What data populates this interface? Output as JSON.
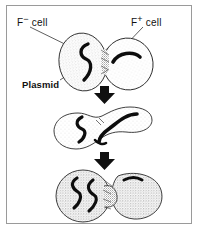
{
  "figure": {
    "background_color": "#ffffff",
    "frame_color": "#9a9a9a",
    "ink_color": "#111111",
    "cell_fill_color": "#fdfdfd",
    "stipple_color": "#8c8c8c"
  },
  "labels": {
    "f_minus": {
      "text": "F",
      "sign": "−",
      "suffix": " cell",
      "full": "F− cell"
    },
    "f_plus": {
      "text": "F",
      "sign": "+",
      "suffix": " cell",
      "full": "F+ cell"
    },
    "plasmid": {
      "text": "Plasmid"
    }
  },
  "stages": [
    {
      "name": "stage-1-contact",
      "description": "Two separate oval bacterial cells touching at a conjugation junction",
      "cells": [
        {
          "name": "f-minus-cell",
          "dna": "chromosome-s-curve",
          "texture": "stippled"
        },
        {
          "name": "f-plus-cell",
          "dna": "plasmid-curve",
          "texture": "light"
        }
      ]
    },
    {
      "name": "stage-2-transfer",
      "description": "Cells fused into a peanut shape; plasmid DNA passing through the bridge",
      "cells": [
        {
          "name": "f-minus-cell",
          "dna": "chromosome-s-curve",
          "texture": "light"
        },
        {
          "name": "f-plus-cell",
          "dna": "plasmid-transferring",
          "texture": "light"
        }
      ]
    },
    {
      "name": "stage-3-separation",
      "description": "Recipient now carries both chromosome and plasmid; cells begin to separate",
      "cells": [
        {
          "name": "recipient-cell",
          "dna": "chromosome-and-plasmid",
          "texture": "heavily-stippled"
        },
        {
          "name": "donor-cell",
          "dna": "plasmid-remnant-dash",
          "texture": "heavily-stippled"
        }
      ]
    }
  ],
  "arrows": [
    {
      "name": "arrow-stage1-to-stage2",
      "direction": "down"
    },
    {
      "name": "arrow-stage2-to-stage3",
      "direction": "down"
    }
  ],
  "leader_lines": [
    {
      "name": "leader-f-minus",
      "from": "f-minus-label",
      "to": "f-minus-cell"
    },
    {
      "name": "leader-f-plus",
      "from": "f-plus-label",
      "to": "f-plus-cell"
    },
    {
      "name": "leader-plasmid",
      "from": "plasmid-label",
      "to": "plasmid-in-f-plus-cell"
    }
  ]
}
